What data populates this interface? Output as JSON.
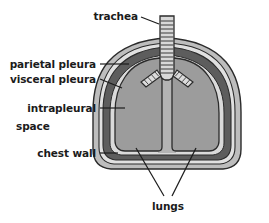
{
  "diagram": {
    "title_visible": false,
    "labels": {
      "trachea": "trachea",
      "parietal_pleura": "parietal pleura",
      "visceral_pleura": "visceral pleura",
      "intrapleural_line1": "intrapleural",
      "intrapleural_line2": "space",
      "chest_wall": "chest wall",
      "lungs": "lungs"
    },
    "colors": {
      "background": "#ffffff",
      "text": "#1b1b1b",
      "leader_line": "#1b1b1b",
      "outline": "#2b2b2b",
      "chest_wall_fill": "#b9b9b9",
      "parietal_pleura_fill": "#dcdcdc",
      "pleura_dark_fill": "#5d5d5d",
      "intrapleural_fill": "#d8d8d8",
      "lung_fill": "#9a9a9a",
      "mediastinum_fill": "#b0b0b0",
      "trachea_fill": "#d6d6d6",
      "trachea_ring": "#3a3a3a"
    },
    "structures": [
      {
        "name": "trachea",
        "description": "vertical ringed airway entering thorax from top"
      },
      {
        "name": "bronchi",
        "description": "two ringed branches splitting left and right from trachea"
      },
      {
        "name": "left-lung",
        "description": "lung lobe, patient right side of image"
      },
      {
        "name": "right-lung",
        "description": "lung lobe, patient left side of image"
      },
      {
        "name": "chest-wall",
        "description": "outer dome-shaped boundary of thorax"
      },
      {
        "name": "parietal-pleura",
        "description": "membrane lining inner chest wall"
      },
      {
        "name": "visceral-pleura",
        "description": "membrane covering lung surface"
      },
      {
        "name": "intrapleural-space",
        "description": "thin space between the two pleural membranes"
      }
    ]
  }
}
